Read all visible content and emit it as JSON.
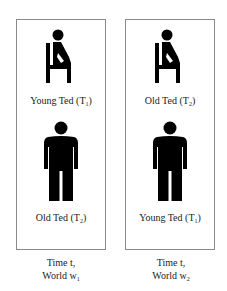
{
  "panels": [
    {
      "top_figure": {
        "icon": "sitting-person-icon",
        "label": "Young Ted (T",
        "label_sub": "1",
        "label_end": ")"
      },
      "bottom_figure": {
        "icon": "standing-person-icon",
        "label": "Old Ted (T",
        "label_sub": "2",
        "label_end": ")"
      },
      "caption_line1": "Time t,",
      "caption_line2": "World w",
      "caption_sub": "1"
    },
    {
      "top_figure": {
        "icon": "sitting-person-icon",
        "label": "Old Ted (T",
        "label_sub": "2",
        "label_end": ")"
      },
      "bottom_figure": {
        "icon": "standing-person-icon",
        "label": "Young Ted (T",
        "label_sub": "1",
        "label_end": ")"
      },
      "caption_line1": "Time t,",
      "caption_line2": "World w",
      "caption_sub": "2"
    }
  ],
  "colors": {
    "figure": "#000000",
    "border": "#8a8a8a",
    "text": "#222222"
  }
}
